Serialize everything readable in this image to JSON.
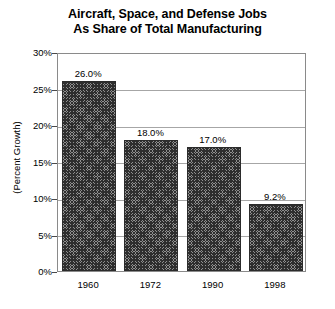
{
  "chart_data": {
    "type": "bar",
    "title": "Aircraft, Space, and Defense Jobs As Share of Total Manufacturing",
    "title_lines": [
      "Aircraft, Space, and Defense Jobs",
      "As Share of Total Manufacturing"
    ],
    "xlabel": "",
    "ylabel": "(Percent Growth)",
    "categories": [
      "1960",
      "1972",
      "1990",
      "1998"
    ],
    "values": [
      26.0,
      17.99,
      17.0,
      9.2
    ],
    "data_labels": [
      "26.0%",
      "18.0%",
      "17.0%",
      "9.2%"
    ],
    "ylim": [
      0,
      30
    ],
    "yticks": [
      0,
      5,
      10,
      15,
      20,
      25,
      30
    ],
    "ytick_labels": [
      "0%",
      "5%",
      "10%",
      "15%",
      "20%",
      "25%",
      "30%"
    ],
    "grid": true,
    "grid_axis": "y",
    "legend": null,
    "legend_position": "none",
    "bar_fill": "#8f8f8f",
    "bar_pattern": "crosshatch",
    "bar_edge_color": "#2b2b2b",
    "gridline_color": "#a6a6a6",
    "plot_border_color": "#8a8a8a",
    "background_color": "#ffffff",
    "text_color": "#000000"
  }
}
